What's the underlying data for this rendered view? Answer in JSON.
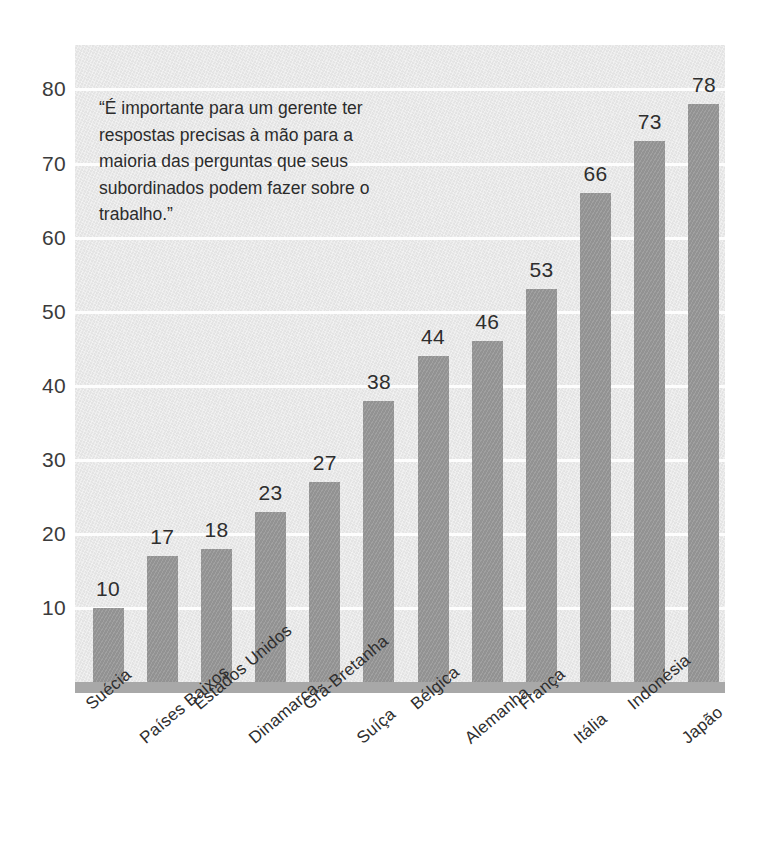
{
  "chart_data": {
    "type": "bar",
    "title": "",
    "subtitle": "",
    "xlabel": "",
    "ylabel": "",
    "ylim": [
      0,
      86
    ],
    "yticks": [
      10,
      20,
      30,
      40,
      50,
      60,
      70,
      80
    ],
    "grid": true,
    "legend": "none",
    "orientation": "vertical",
    "categories": [
      "Suécia",
      "Países Baixos",
      "Estados Unidos",
      "Dinamarca",
      "Grã-Bretanha",
      "Suíça",
      "Bélgica",
      "Alemanha",
      "França",
      "Itália",
      "Indonésia",
      "Japão"
    ],
    "values": [
      10,
      17,
      18,
      23,
      27,
      38,
      44,
      46,
      53,
      66,
      73,
      78
    ],
    "value_labels": [
      "10",
      "17",
      "18",
      "23",
      "27",
      "38",
      "44",
      "46",
      "53",
      "66",
      "73",
      "78"
    ],
    "annotations": [
      {
        "id": "quote",
        "text": "“É importante para um gerente ter respostas precisas à mão para a maioria das perguntas que seus subordinados podem fazer sobre o trabalho.”",
        "position": "top-left"
      }
    ],
    "colors": {
      "bar": "#9a9a9a",
      "plot_background": "#e9e9e9",
      "gridline": "#fdfdfd",
      "baseline": "#a8a8a8",
      "text": "#2e2e2e",
      "page_background": "#ffffff"
    }
  },
  "axis": {
    "y_tick_labels": [
      "80",
      "70",
      "60",
      "50",
      "40",
      "30",
      "20",
      "10"
    ]
  }
}
